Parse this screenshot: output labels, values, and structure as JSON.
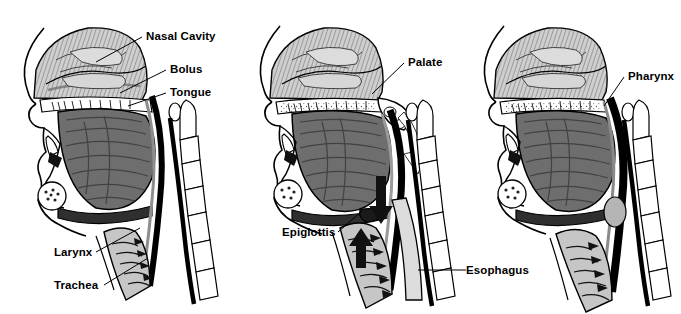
{
  "figure": {
    "background_color": "#ffffff",
    "ink_color": "#000000",
    "panel_count": 3
  },
  "palette": {
    "ink": "#000000",
    "tongue_gray": "#6f6f6f",
    "tongue_dark": "#4a4a4a",
    "nasal_gray": "#c9c9c9",
    "bolus_light": "#d8d8d8",
    "soft_gray": "#a8a8a8",
    "white": "#ffffff",
    "shadow": "#2b2b2b"
  },
  "panels": [
    {
      "id": "panel-1",
      "name": "oral-preparatory-phase",
      "labels": [
        {
          "id": "nasal-cavity",
          "text": "Nasal Cavity",
          "x": 146,
          "y": 30,
          "align": "left",
          "leader": {
            "x1": 142,
            "y1": 37,
            "x2": 96,
            "y2": 62
          }
        },
        {
          "id": "bolus",
          "text": "Bolus",
          "x": 170,
          "y": 63,
          "align": "left",
          "leader": {
            "x1": 166,
            "y1": 70,
            "x2": 120,
            "y2": 93
          }
        },
        {
          "id": "tongue",
          "text": "Tongue",
          "x": 170,
          "y": 86,
          "align": "left",
          "leader": {
            "x1": 166,
            "y1": 93,
            "x2": 128,
            "y2": 106
          }
        },
        {
          "id": "larynx",
          "text": "Larynx",
          "x": 54,
          "y": 246,
          "align": "left",
          "leader": {
            "x1": 96,
            "y1": 252,
            "x2": 140,
            "y2": 228
          }
        },
        {
          "id": "trachea",
          "text": "Trachea",
          "x": 54,
          "y": 279,
          "align": "left",
          "leader": {
            "x1": 104,
            "y1": 285,
            "x2": 148,
            "y2": 258
          }
        }
      ]
    },
    {
      "id": "panel-2",
      "name": "pharyngeal-phase",
      "labels": [
        {
          "id": "palate",
          "text": "Palate",
          "x": 408,
          "y": 56,
          "align": "left",
          "leader": {
            "x1": 404,
            "y1": 63,
            "x2": 372,
            "y2": 94
          }
        },
        {
          "id": "epiglottis",
          "text": "Epiglottis",
          "x": 282,
          "y": 226,
          "align": "left",
          "leader": {
            "x1": 338,
            "y1": 232,
            "x2": 362,
            "y2": 211
          }
        },
        {
          "id": "esophagus",
          "text": "Esophagus",
          "x": 466,
          "y": 264,
          "align": "left",
          "leader": {
            "x1": 462,
            "y1": 270,
            "x2": 418,
            "y2": 270
          }
        }
      ]
    },
    {
      "id": "panel-3",
      "name": "esophageal-phase",
      "labels": [
        {
          "id": "pharynx",
          "text": "Pharynx",
          "x": 628,
          "y": 70,
          "align": "left",
          "leader": {
            "x1": 624,
            "y1": 77,
            "x2": 604,
            "y2": 106
          }
        }
      ]
    }
  ],
  "arrows": [
    {
      "id": "bolus-flow-down-arrow",
      "panel": "panel-2",
      "direction": "down"
    },
    {
      "id": "larynx-elevation-arrow",
      "panel": "panel-2",
      "direction": "up"
    },
    {
      "id": "palate-flow-arrow",
      "panel": "panel-2",
      "direction": "down-right"
    }
  ],
  "structures": [
    "nasal-cavity",
    "hard-palate",
    "soft-palate",
    "tongue",
    "bolus",
    "mandible",
    "epiglottis",
    "larynx",
    "trachea",
    "esophagus",
    "pharynx",
    "cervical-vertebrae",
    "spinal-cord",
    "lips"
  ]
}
